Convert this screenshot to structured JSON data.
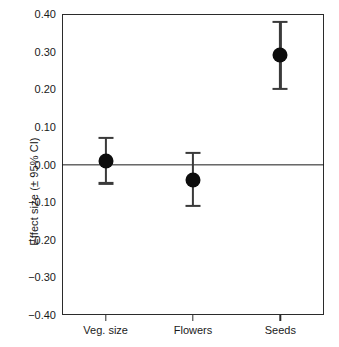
{
  "chart_data": {
    "type": "scatter",
    "title": "",
    "xlabel": "",
    "ylabel": "Effect size (± 95% CI)",
    "categories": [
      "Veg. size",
      "Flowers",
      "Seeds"
    ],
    "values": [
      0.01,
      -0.04,
      0.29
    ],
    "ci_lower": [
      -0.05,
      -0.11,
      0.2
    ],
    "ci_upper": [
      0.07,
      0.03,
      0.38
    ],
    "ylim": [
      -0.4,
      0.4
    ],
    "ytick_labels": [
      "0.40",
      "0.30",
      "0.20",
      "0.10",
      "0.00",
      "−0.10",
      "−0.20",
      "−0.30",
      "−0.40"
    ],
    "ytick_values": [
      0.4,
      0.3,
      0.2,
      0.1,
      0.0,
      -0.1,
      -0.2,
      -0.3,
      -0.4
    ],
    "grid": false,
    "legend": "none",
    "reference_line": 0.0,
    "marker_style": "filled-circle",
    "marker_color": "#0d0d0d",
    "errorbar_color": "#3a3a3a",
    "axis_color": "#2b2b2b",
    "background_color": "#ffffff",
    "points": [
      {
        "category": "Veg. size",
        "value": 0.01,
        "ci_lower": -0.05,
        "ci_upper": 0.07
      },
      {
        "category": "Flowers",
        "value": -0.04,
        "ci_lower": -0.11,
        "ci_upper": 0.03
      },
      {
        "category": "Seeds",
        "value": 0.29,
        "ci_lower": 0.2,
        "ci_upper": 0.38
      }
    ]
  }
}
